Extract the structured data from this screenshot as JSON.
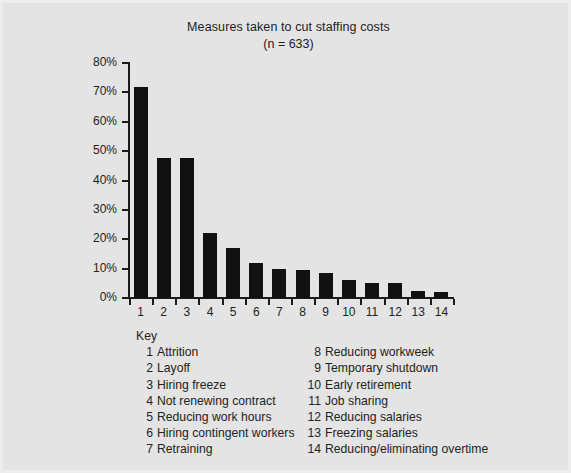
{
  "chart_data": {
    "type": "bar",
    "title": "Measures taken to cut staffing costs",
    "subtitle": "(n = 633)",
    "xlabel": "",
    "ylabel": "",
    "ylim": [
      0,
      80
    ],
    "grid": false,
    "legend_position": "below-plot",
    "bar_color": "#111111",
    "categories": [
      "1",
      "2",
      "3",
      "4",
      "5",
      "6",
      "7",
      "8",
      "9",
      "10",
      "11",
      "12",
      "13",
      "14"
    ],
    "values": [
      72,
      47.5,
      47.5,
      22,
      17,
      12,
      10,
      9.5,
      8.5,
      6,
      5,
      5,
      2.5,
      2
    ],
    "ytick_labels": [
      "80%",
      "70%",
      "60%",
      "50%",
      "40%",
      "30%",
      "20%",
      "10%",
      "0%"
    ],
    "ytick_values": [
      80,
      70,
      60,
      50,
      40,
      30,
      20,
      10,
      0
    ],
    "xtick_labels": [
      "1",
      "2",
      "3",
      "4",
      "5",
      "6",
      "7",
      "8",
      "9",
      "10",
      "11",
      "12",
      "13",
      "14"
    ]
  },
  "key": {
    "heading": "Key",
    "left_column": [
      {
        "num": "1",
        "label": "Attrition"
      },
      {
        "num": "2",
        "label": "Layoff"
      },
      {
        "num": "3",
        "label": "Hiring freeze"
      },
      {
        "num": "4",
        "label": "Not renewing contract"
      },
      {
        "num": "5",
        "label": "Reducing work hours"
      },
      {
        "num": "6",
        "label": "Hiring contingent workers"
      },
      {
        "num": "7",
        "label": "Retraining"
      }
    ],
    "right_column": [
      {
        "num": "8",
        "label": "Reducing workweek"
      },
      {
        "num": "9",
        "label": "Temporary shutdown"
      },
      {
        "num": "10",
        "label": "Early retirement"
      },
      {
        "num": "11",
        "label": "Job sharing"
      },
      {
        "num": "12",
        "label": "Reducing salaries"
      },
      {
        "num": "13",
        "label": "Freezing salaries"
      },
      {
        "num": "14",
        "label": "Reducing/eliminating overtime"
      }
    ]
  }
}
